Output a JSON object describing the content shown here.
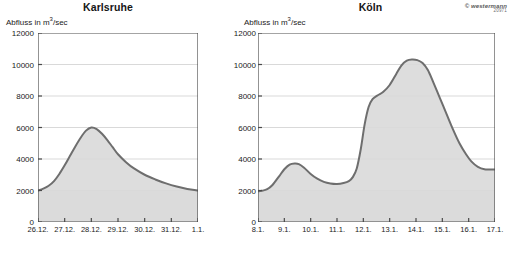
{
  "copyright": {
    "brand": "© westermann",
    "code": "20971"
  },
  "common": {
    "y_axis_label_prefix": "Abfluss in m",
    "y_axis_label_exponent": "3",
    "y_axis_label_suffix": "/sec",
    "fill_color": "#d9d9d9",
    "line_color": "#6e6e6e",
    "grid_color": "#c8c8c8",
    "axis_color": "#4a4a4a",
    "baseline_band_color": "#ebebeb"
  },
  "chart_data": [
    {
      "type": "area",
      "title": "Karlsruhe",
      "xlabel": "",
      "ylabel": "Abfluss in m3/sec",
      "ylim": [
        0,
        12000
      ],
      "ytick_values": [
        0,
        2000,
        4000,
        6000,
        8000,
        10000,
        12000
      ],
      "ytick_labels": [
        "0",
        "2000",
        "4000",
        "6000",
        "8000",
        "10000",
        "12000"
      ],
      "grid": true,
      "grid_values": [
        2000,
        4000,
        6000,
        8000,
        10000
      ],
      "legend": "none",
      "categories": [
        "26.12.",
        "27.12.",
        "28.12.",
        "29.12.",
        "30.12.",
        "31.12.",
        "1.1."
      ],
      "x": [
        0,
        1,
        2,
        3,
        4,
        5,
        6
      ],
      "series": [
        {
          "name": "Abfluss Karlsruhe",
          "x": [
            0.0,
            0.2,
            0.4,
            0.6,
            0.8,
            1.0,
            1.2,
            1.4,
            1.6,
            1.8,
            2.0,
            2.2,
            2.4,
            2.6,
            2.8,
            3.0,
            3.3,
            3.6,
            4.0,
            4.4,
            4.8,
            5.2,
            5.6,
            6.0
          ],
          "values": [
            2000,
            2120,
            2300,
            2600,
            3050,
            3600,
            4200,
            4800,
            5350,
            5800,
            6000,
            5900,
            5600,
            5200,
            4750,
            4300,
            3800,
            3400,
            3000,
            2700,
            2450,
            2250,
            2100,
            2000
          ]
        }
      ]
    },
    {
      "type": "area",
      "title": "Köln",
      "xlabel": "",
      "ylabel": "Abfluss in m3/sec",
      "ylim": [
        0,
        12000
      ],
      "ytick_values": [
        0,
        2000,
        4000,
        6000,
        8000,
        10000,
        12000
      ],
      "ytick_labels": [
        "0",
        "2000",
        "4000",
        "6000",
        "8000",
        "10000",
        "12000"
      ],
      "grid": true,
      "grid_values": [
        2000,
        4000,
        6000,
        8000,
        10000
      ],
      "legend": "none",
      "categories": [
        "8.1.",
        "9.1.",
        "10.1.",
        "11.1.",
        "12.1.",
        "13.1.",
        "14.1.",
        "15.1.",
        "16.1.",
        "17.1."
      ],
      "x": [
        0,
        1,
        2,
        3,
        4,
        5,
        6,
        7,
        8,
        9
      ],
      "series": [
        {
          "name": "Abfluss Köln",
          "x": [
            0.0,
            0.15,
            0.35,
            0.55,
            0.8,
            1.0,
            1.2,
            1.4,
            1.55,
            1.75,
            2.0,
            2.25,
            2.5,
            2.75,
            3.0,
            3.25,
            3.45,
            3.6,
            3.75,
            3.9,
            4.05,
            4.2,
            4.35,
            4.55,
            4.75,
            5.0,
            5.25,
            5.45,
            5.65,
            5.85,
            6.05,
            6.25,
            6.45,
            6.65,
            6.9,
            7.15,
            7.4,
            7.65,
            7.9,
            8.1,
            8.35,
            8.6,
            9.0
          ],
          "values": [
            1950,
            1980,
            2080,
            2350,
            2900,
            3350,
            3650,
            3720,
            3680,
            3450,
            3050,
            2750,
            2550,
            2450,
            2420,
            2480,
            2600,
            2850,
            3400,
            4600,
            6200,
            7300,
            7800,
            8050,
            8250,
            8700,
            9400,
            9950,
            10250,
            10320,
            10280,
            10100,
            9650,
            8900,
            7900,
            6900,
            5900,
            5000,
            4300,
            3850,
            3500,
            3350,
            3330
          ]
        }
      ]
    }
  ]
}
